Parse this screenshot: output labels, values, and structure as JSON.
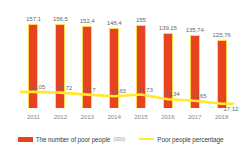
{
  "chart_data": {
    "type": "bar",
    "title": "",
    "subtitle": "",
    "xlabel": "",
    "ylabel": "",
    "grid": false,
    "legend_position": "bottom",
    "categories": [
      "2011",
      "2012",
      "2013",
      "2014",
      "2015",
      "2016",
      "2017",
      "2018"
    ],
    "series": [
      {
        "name": "The number of poor people",
        "unit": "(000)",
        "type": "bar",
        "color": "#E8431F",
        "outline_color": "#FFD84D",
        "values": [
          157.1,
          156.5,
          152.4,
          148.4,
          155,
          139.15,
          135.74,
          125.76
        ],
        "labels": [
          "157,1",
          "156,5",
          "152,4",
          "148,4",
          "155",
          "139,15",
          "135,74",
          "125,76"
        ],
        "ylim": [
          0,
          175
        ]
      },
      {
        "name": "Poor people percentage",
        "unit": "",
        "type": "line",
        "color": "#FFE82E",
        "values": [
          23.05,
          22.72,
          21.7,
          20.83,
          21.73,
          19.34,
          18.65,
          17.12
        ],
        "labels": [
          "23,05",
          "22,72",
          "21,7",
          "20,83",
          "21,73",
          "19,34",
          "18,65",
          "17,12"
        ],
        "ylim": [
          0,
          26
        ]
      }
    ]
  },
  "legend": {
    "bar_label": "The number of poor people",
    "bar_unit": "(000)",
    "line_label": "Poor people percentage"
  }
}
